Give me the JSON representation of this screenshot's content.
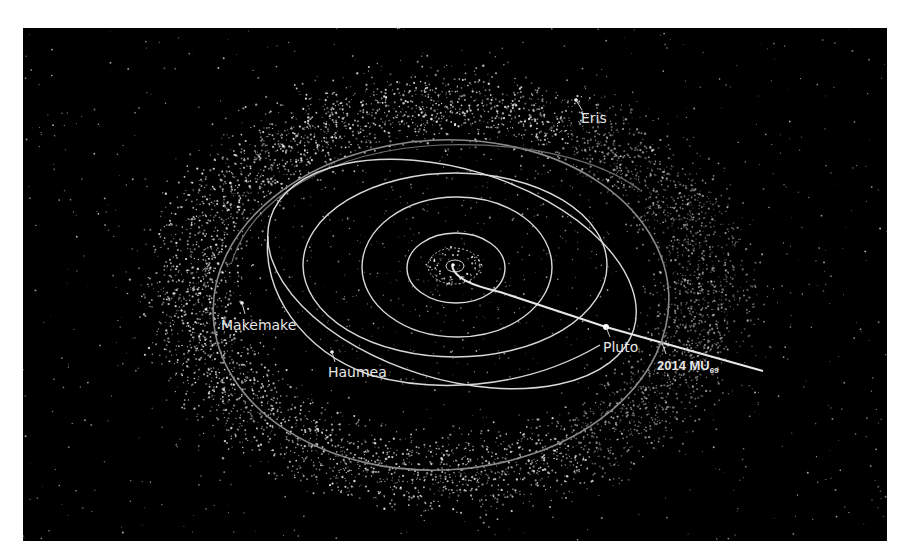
{
  "diagram": {
    "background_color": "#000000",
    "orbit_color": "#d9d9d9",
    "belt_color": "#8a8a8a",
    "objects": [
      {
        "id": "eris",
        "label": "Eris"
      },
      {
        "id": "makemake",
        "label": "Makemake"
      },
      {
        "id": "haumea",
        "label": "Haumea"
      },
      {
        "id": "pluto",
        "label": "Pluto"
      },
      {
        "id": "mu69",
        "label": "2014 MU",
        "label_subscript": "69"
      }
    ],
    "orbits": [
      {
        "name": "inner-planets-orbit"
      },
      {
        "name": "jupiter-orbit"
      },
      {
        "name": "saturn-orbit"
      },
      {
        "name": "uranus-orbit"
      },
      {
        "name": "neptune-orbit"
      },
      {
        "name": "pluto-orbit"
      },
      {
        "name": "kuiper-belt-outer-orbit"
      }
    ],
    "trajectory": {
      "name": "new-horizons-trajectory"
    }
  }
}
